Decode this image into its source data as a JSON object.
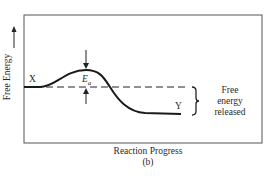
{
  "diagram": {
    "type": "energy-profile",
    "caption": "(b)",
    "x_axis_label": "Reaction Progress",
    "y_axis_label": "Free Energy",
    "y_axis_arrow": "up-arrow",
    "reactant_label": "X",
    "product_label": "Y",
    "activation_energy_label": "E",
    "activation_energy_subscript": "a",
    "brace_label_lines": [
      "Free",
      "energy",
      "released"
    ],
    "curve": {
      "description": "Exergonic reaction: starts at X, rises over activation hump Ea, falls to lower energy Y",
      "reactant_level": "high",
      "product_level": "low",
      "peak": "activation barrier"
    },
    "colors": {
      "line": "#1a1a1a",
      "frame": "#555555",
      "text": "#2a2a2a",
      "background": "#ffffff"
    }
  }
}
